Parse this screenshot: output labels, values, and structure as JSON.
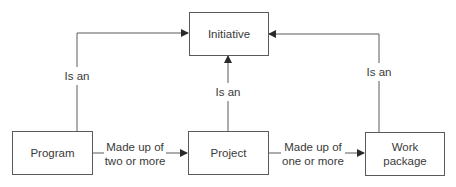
{
  "diagram": {
    "line_color": "#5a5a5a",
    "nodes": {
      "initiative": "Initiative",
      "program": "Program",
      "project": "Project",
      "work_package": "Work package"
    },
    "edges": {
      "program_to_initiative": "Is an",
      "project_to_initiative": "Is an",
      "work_package_to_initiative": "Is an",
      "program_to_project_line1": "Made up of",
      "program_to_project_line2": "two or more",
      "project_to_work_package_line1": "Made up of",
      "project_to_work_package_line2": "one or more"
    }
  }
}
